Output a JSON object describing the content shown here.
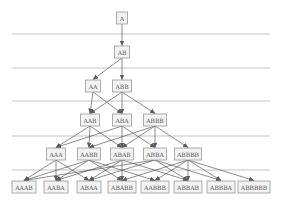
{
  "diagram": {
    "type": "layered-derivation-graph",
    "colors": {
      "node_fill": "#f2f2f2",
      "node_border": "#9a9a9a",
      "text": "#555555",
      "edge": "#5a5a5a",
      "separator": "#b5b5b5"
    },
    "separators_y": [
      34,
      68,
      101,
      136,
      170
    ],
    "separator_x": [
      12,
      270
    ],
    "levels": [
      {
        "level": 0,
        "y": 18,
        "nodes": [
          {
            "id": "A",
            "label": "A",
            "x": 122,
            "w": 11
          }
        ]
      },
      {
        "level": 1,
        "y": 52,
        "nodes": [
          {
            "id": "AB",
            "label": "AB",
            "x": 122,
            "w": 15
          }
        ]
      },
      {
        "level": 2,
        "y": 86,
        "nodes": [
          {
            "id": "AA",
            "label": "AA",
            "x": 93,
            "w": 15
          },
          {
            "id": "ABB",
            "label": "ABB",
            "x": 122,
            "w": 19
          }
        ]
      },
      {
        "level": 3,
        "y": 120,
        "nodes": [
          {
            "id": "AAB",
            "label": "AAB",
            "x": 90,
            "w": 19
          },
          {
            "id": "ABA",
            "label": "ABA",
            "x": 122,
            "w": 19
          },
          {
            "id": "ABBB",
            "label": "ABBB",
            "x": 155,
            "w": 23
          }
        ]
      },
      {
        "level": 4,
        "y": 154,
        "nodes": [
          {
            "id": "AAA",
            "label": "AAA",
            "x": 56,
            "w": 19
          },
          {
            "id": "AABB",
            "label": "AABB",
            "x": 89,
            "w": 23
          },
          {
            "id": "ABAB",
            "label": "ABAB",
            "x": 122,
            "w": 23
          },
          {
            "id": "ABBA",
            "label": "ABBA",
            "x": 155,
            "w": 23
          },
          {
            "id": "ABBBB",
            "label": "ABBBB",
            "x": 188,
            "w": 27
          }
        ]
      },
      {
        "level": 5,
        "y": 187,
        "nodes": [
          {
            "id": "AAAB",
            "label": "AAAB",
            "x": 24,
            "w": 24
          },
          {
            "id": "AABA",
            "label": "AABA",
            "x": 56,
            "w": 24
          },
          {
            "id": "ABAA",
            "label": "ABAA",
            "x": 89,
            "w": 24
          },
          {
            "id": "ABABB",
            "label": "ABABB",
            "x": 122,
            "w": 28
          },
          {
            "id": "AABBB",
            "label": "AABBB",
            "x": 155,
            "w": 28
          },
          {
            "id": "ABBAB",
            "label": "ABBAB",
            "x": 188,
            "w": 28
          },
          {
            "id": "ABBBA",
            "label": "ABBBA",
            "x": 221,
            "w": 28
          },
          {
            "id": "ABBBBB",
            "label": "ABBBBB",
            "x": 254,
            "w": 32
          }
        ]
      }
    ],
    "edges": [
      [
        "A",
        "AB"
      ],
      [
        "AB",
        "AA"
      ],
      [
        "AB",
        "ABB"
      ],
      [
        "AA",
        "AAB"
      ],
      [
        "AA",
        "ABA"
      ],
      [
        "ABB",
        "AAB"
      ],
      [
        "ABB",
        "ABA"
      ],
      [
        "ABB",
        "ABBB"
      ],
      [
        "AAB",
        "AAA"
      ],
      [
        "AAB",
        "AABB"
      ],
      [
        "AAB",
        "ABAB"
      ],
      [
        "ABA",
        "AAA"
      ],
      [
        "ABA",
        "ABAB"
      ],
      [
        "ABA",
        "ABBA"
      ],
      [
        "ABBB",
        "AABB"
      ],
      [
        "ABBB",
        "ABAB"
      ],
      [
        "ABBB",
        "ABBA"
      ],
      [
        "ABBB",
        "ABBBB"
      ],
      [
        "AAA",
        "AAAB"
      ],
      [
        "AAA",
        "AABA"
      ],
      [
        "AAA",
        "ABAA"
      ],
      [
        "AABB",
        "AAAB"
      ],
      [
        "AABB",
        "AABA"
      ],
      [
        "AABB",
        "ABABB"
      ],
      [
        "AABB",
        "AABBB"
      ],
      [
        "ABAB",
        "AABA"
      ],
      [
        "ABAB",
        "ABAA"
      ],
      [
        "ABAB",
        "ABABB"
      ],
      [
        "ABAB",
        "ABBAB"
      ],
      [
        "ABBA",
        "AAAB"
      ],
      [
        "ABBA",
        "ABAA"
      ],
      [
        "ABBA",
        "ABBAB"
      ],
      [
        "ABBA",
        "ABBBA"
      ],
      [
        "ABBBB",
        "ABABB"
      ],
      [
        "ABBBB",
        "AABBB"
      ],
      [
        "ABBBB",
        "ABBAB"
      ],
      [
        "ABBBB",
        "ABBBA"
      ],
      [
        "ABBBB",
        "ABBBBB"
      ]
    ]
  }
}
